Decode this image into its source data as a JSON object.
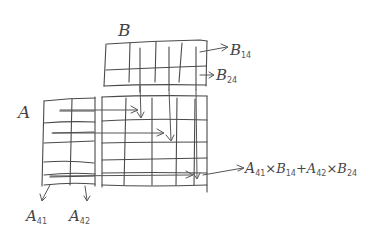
{
  "diagram": {
    "type": "hand-drawn matrix multiplication illustration",
    "matrix_b": {
      "label": "B",
      "row_labels": [
        "B14",
        "B24"
      ],
      "rows": 2,
      "cols": 6
    },
    "matrix_a": {
      "label": "A",
      "column_labels": [
        "A41",
        "A42"
      ],
      "rows": 6,
      "cols": 2
    },
    "result": {
      "rows": 6,
      "cols": 6
    },
    "formula": "A41×B14+A42×B24",
    "labels": {
      "b": "B",
      "a": "A",
      "b14_main": "B",
      "b14_sub": "14",
      "b24_main": "B",
      "b24_sub": "24",
      "a41_main": "A",
      "a41_sub": "41",
      "a42_main": "A",
      "a42_sub": "42",
      "formula_parts": [
        "A",
        "41",
        "×B",
        "14",
        "+A",
        "42",
        "×B",
        "24"
      ]
    },
    "stroke_color": "#4a4a4a",
    "background": "#ffffff"
  }
}
